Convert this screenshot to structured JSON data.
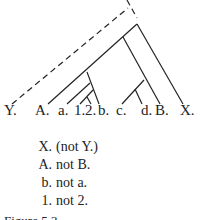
{
  "leaves": [
    "Y.",
    "A.",
    "a.",
    "1.",
    "2.",
    "b.",
    "c.",
    "d.",
    "B.",
    "X."
  ],
  "rules": [
    {
      "key": "X.",
      "text": "(not Y.)"
    },
    {
      "key": "A.",
      "text": "not B."
    },
    {
      "key": "b.",
      "text": "not a."
    },
    {
      "key": "1.",
      "text": "not 2."
    }
  ],
  "caption": "Figure 5.3",
  "colors": {
    "line": "#222222",
    "background": "#ffffff"
  }
}
